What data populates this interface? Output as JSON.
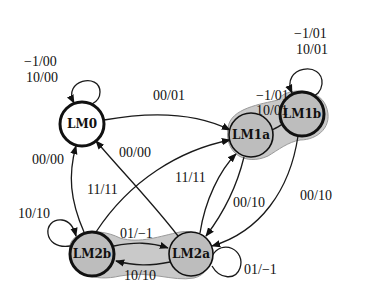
{
  "diagram": {
    "type": "state-machine",
    "nodes": [
      {
        "id": "LM0",
        "label": "LM0",
        "shaded": false
      },
      {
        "id": "LM1a",
        "label": "LM1a",
        "shaded": true
      },
      {
        "id": "LM1b",
        "label": "LM1b",
        "shaded": true
      },
      {
        "id": "LM2b",
        "label": "LM2b",
        "shaded": true
      },
      {
        "id": "LM2a",
        "label": "LM2a",
        "shaded": true
      }
    ],
    "edges": [
      {
        "from": "LM0",
        "to": "LM0",
        "label_lines": [
          "−1/00",
          "10/00"
        ]
      },
      {
        "from": "LM0",
        "to": "LM1a",
        "label_lines": [
          "00/01"
        ]
      },
      {
        "from": "LM2b",
        "to": "LM0",
        "label_lines": [
          "00/00"
        ]
      },
      {
        "from": "LM2a",
        "to": "LM0",
        "label_lines": [
          "00/00"
        ]
      },
      {
        "from": "LM2b",
        "to": "LM1a",
        "label_lines": [
          "11/11"
        ]
      },
      {
        "from": "LM2a",
        "to": "LM1a",
        "label_lines": [
          "11/11"
        ]
      },
      {
        "from": "LM1a",
        "to": "LM2a",
        "label_lines": [
          "00/10"
        ]
      },
      {
        "from": "LM1b",
        "to": "LM2a",
        "label_lines": [
          "00/10"
        ]
      },
      {
        "from": "LM1a",
        "to": "LM1b",
        "label_lines": [
          "−1/01",
          "10/01"
        ]
      },
      {
        "from": "LM1b",
        "to": "LM1b",
        "label_lines": [
          "−1/01",
          "10/01"
        ]
      },
      {
        "from": "LM2b",
        "to": "LM2b",
        "label_lines": [
          "10/10"
        ]
      },
      {
        "from": "LM2b",
        "to": "LM2a",
        "label_lines": [
          "01/−1"
        ]
      },
      {
        "from": "LM2a",
        "to": "LM2b",
        "label_lines": [
          "10/10"
        ]
      },
      {
        "from": "LM2a",
        "to": "LM2a",
        "label_lines": [
          "01/−1"
        ]
      }
    ],
    "groups": [
      {
        "members": [
          "LM1a",
          "LM1b"
        ],
        "style": "shaded"
      },
      {
        "members": [
          "LM2b",
          "LM2a"
        ],
        "style": "shaded"
      }
    ]
  },
  "labels": {
    "lm0": "LM0",
    "lm1a": "LM1a",
    "lm1b": "LM1b",
    "lm2b": "LM2b",
    "lm2a": "LM2a",
    "lm0_loop_1": "−1/00",
    "lm0_loop_2": "10/00",
    "lm0_to_lm1a": "00/01",
    "lm2b_to_lm0": "00/00",
    "lm2a_to_lm0": "00/00",
    "lm2b_to_lm1a": "11/11",
    "lm2a_to_lm1a": "11/11",
    "lm1a_to_lm2a": "00/10",
    "lm1b_to_lm2a": "00/10",
    "lm1a_to_lm1b_1": "−1/01",
    "lm1a_to_lm1b_2": "10/01",
    "lm1b_loop_1": "−1/01",
    "lm1b_loop_2": "10/01",
    "lm2b_loop": "10/10",
    "lm2b_to_lm2a": "01/−1",
    "lm2a_to_lm2b": "10/10",
    "lm2a_loop": "01/−1"
  }
}
